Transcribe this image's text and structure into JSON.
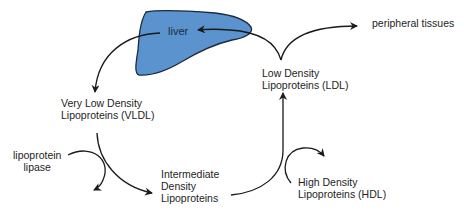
{
  "diagram": {
    "type": "lipoprotein metabolism cycle",
    "colors": {
      "liver_fill": "#5b93cf",
      "liver_stroke": "#1b2a3d",
      "arrow": "#1a1a1a",
      "text": "#1e1e1e"
    },
    "nodes": {
      "liver": {
        "label": "liver"
      },
      "peripheral": {
        "label": "peripheral tissues"
      },
      "ldl": {
        "line1": "Low Density",
        "line2": "Lipoproteins (LDL)"
      },
      "vldl": {
        "line1": "Very Low Density",
        "line2": "Lipoproteins (VLDL)"
      },
      "lipase": {
        "line1": "lipoprotein",
        "line2": "lipase"
      },
      "idl": {
        "line1": "Intermediate",
        "line2": "Density",
        "line3": "Lipoproteins"
      },
      "hdl": {
        "line1": "High Density",
        "line2": "Lipoproteins (HDL)"
      }
    },
    "edges": [
      {
        "from": "liver",
        "to": "vldl"
      },
      {
        "from": "vldl",
        "to": "idl",
        "via": "lipoprotein lipase"
      },
      {
        "from": "idl",
        "to": "ldl",
        "via": "HDL"
      },
      {
        "from": "ldl",
        "to": "liver"
      },
      {
        "from": "ldl",
        "to": "peripheral tissues"
      }
    ]
  }
}
